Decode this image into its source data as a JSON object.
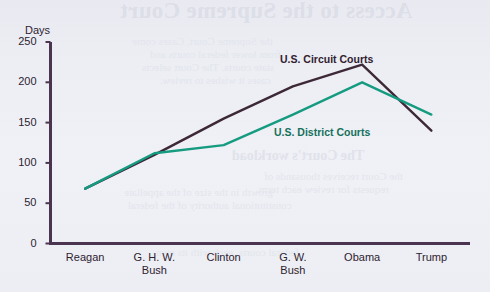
{
  "chart_data": {
    "type": "line",
    "title": "",
    "xlabel": "",
    "ylabel": "Days",
    "ylim": [
      0,
      250
    ],
    "yticks": [
      0,
      50,
      100,
      150,
      200,
      250
    ],
    "grid": false,
    "legend_position": "inline-annotation",
    "categories": [
      "Reagan",
      "G. H. W. Bush",
      "Clinton",
      "G. W. Bush",
      "Obama",
      "Trump"
    ],
    "series": [
      {
        "name": "U.S. Circuit Courts",
        "color": "#3d2838",
        "values": [
          68,
          110,
          155,
          195,
          222,
          140
        ]
      },
      {
        "name": "U.S. District Courts",
        "color": "#159b80",
        "values": [
          68,
          112,
          122,
          160,
          200,
          160
        ]
      }
    ]
  },
  "axes": {
    "y_axis_title": "Days",
    "y_tick_labels": [
      "250",
      "200",
      "150",
      "100",
      "50",
      "0"
    ],
    "x_tick_labels": [
      "Reagan",
      "G. H. W.\nBush",
      "Clinton",
      "G. W.\nBush",
      "Obama",
      "Trump"
    ]
  },
  "annotations": {
    "circuit_label": "U.S. Circuit Courts",
    "district_label": "U.S. District Courts"
  },
  "colors": {
    "background": "#eceef4",
    "axis": "#4b3450",
    "circuit": "#3d2838",
    "district": "#159b80",
    "text": "#2e2230"
  },
  "bleed_through": {
    "title": "Access to the Supreme Court",
    "subtitle": "The Court's workload",
    "lines": [
      "the Supreme Court. Cases come",
      "from lower federal courts and",
      "state courts. The Court selects",
      "cases it wishes to review.",
      "growth in the size of the appellate",
      "constitutional authority of the federal",
      "federal courts, each with its own",
      "the Court receives thousands of",
      "requests for review each term."
    ]
  }
}
